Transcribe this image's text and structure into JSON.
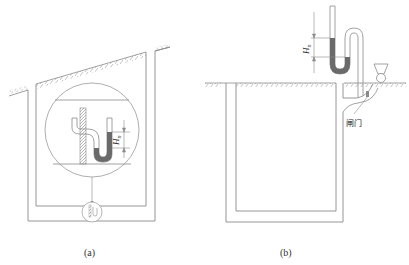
{
  "figure": {
    "panels": [
      {
        "id": "a",
        "caption": "(a)",
        "description": "Pit under sloped ground with magnified inset of U-tube water seal (trap) showing seal height",
        "dimension_label": "H",
        "dimension_subscript": "n"
      },
      {
        "id": "b",
        "caption": "(b)",
        "description": "Underground pit with U-tube manometer/seal above ground and gate valve on outlet",
        "dimension_label": "H",
        "dimension_subscript": "n",
        "annotation": "闸门"
      }
    ],
    "colors": {
      "line": "#8a8a8a",
      "fluid": "#6a6a6a",
      "hatch": "#9a9a9a",
      "background": "#ffffff"
    }
  }
}
